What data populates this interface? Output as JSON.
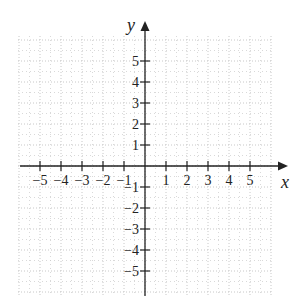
{
  "chart_data": {
    "type": "scatter",
    "title": "",
    "xlabel": "x",
    "ylabel": "y",
    "xlim": [
      -6,
      6
    ],
    "ylim": [
      -6,
      6
    ],
    "x_ticks": [
      -5,
      -4,
      -3,
      -2,
      -1,
      1,
      2,
      3,
      4,
      5
    ],
    "y_ticks": [
      -5,
      -4,
      -3,
      -2,
      -1,
      1,
      2,
      3,
      4,
      5
    ],
    "x_tick_labels": [
      "−5",
      "−4",
      "−3",
      "−2",
      "−1",
      "1",
      "2",
      "3",
      "4",
      "5"
    ],
    "y_tick_labels": [
      "−5",
      "−4",
      "−3",
      "−2",
      "−1",
      "1",
      "2",
      "3",
      "4",
      "5"
    ],
    "grid": true,
    "grid_style": "dotted",
    "series": [],
    "legend": null
  },
  "colors": {
    "axis": "#222222",
    "grid": "#c8c8c8",
    "background": "#ffffff"
  }
}
